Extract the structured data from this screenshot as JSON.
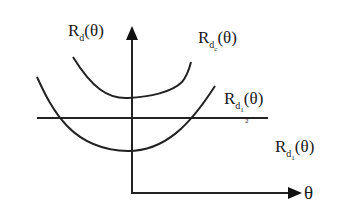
{
  "diagram": {
    "axes": {
      "y_label": {
        "base": "R",
        "subscript": "d",
        "arg": "(θ)"
      },
      "x_label": "θ"
    },
    "curves": [
      {
        "id": "upper-curve",
        "label": {
          "base": "R",
          "subscript": "d",
          "subsub": "c",
          "arg": "(θ)"
        }
      },
      {
        "id": "lower-curve",
        "label": {
          "base": "R",
          "subscript": "d",
          "subsub": "1",
          "subsub_den": "2",
          "arg": "(θ)"
        }
      },
      {
        "id": "flat-line",
        "label": {
          "base": "R",
          "subscript": "d",
          "subsub": "1",
          "arg": "(θ)"
        }
      }
    ],
    "colors": {
      "stroke": "#222222",
      "background": "#ffffff"
    }
  }
}
